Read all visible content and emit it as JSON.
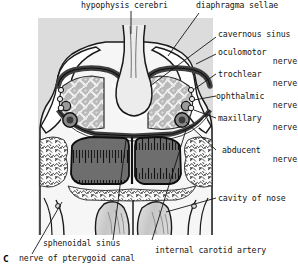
{
  "figure": {
    "panel_key": "C",
    "caption_label": "nerve of pterygoid canal",
    "background": "#ffffff",
    "panel_background": "#dcdcdc",
    "ink": "#141414",
    "colors": {
      "panel_bg": "#dcdcdc",
      "bone_light": "#f2f2f2",
      "dura_dark": "#4a4a4a",
      "cavernous_sinus_fill": "#b8b8b8",
      "sphenoid_sinus_fill": "#6e6e6e",
      "concha_fill": "#cfcfcf",
      "pituitary_fill": "#e8e8e8",
      "leader_line": "#1a1a1a"
    },
    "labels": [
      {
        "id": "hypophysis-cerebri",
        "text": "hypophysis cerebri",
        "line1": "hypophysis cerebri",
        "line2": ""
      },
      {
        "id": "diaphragma-sellae",
        "text": "diaphragma sellae",
        "line1": "diaphragma sellae",
        "line2": ""
      },
      {
        "id": "cavernous-sinus",
        "text": "cavernous sinus",
        "line1": "cavernous sinus",
        "line2": ""
      },
      {
        "id": "oculomotor-nerve",
        "text": "oculomotor nerve",
        "line1": "oculomotor",
        "line2": "nerve"
      },
      {
        "id": "trochlear-nerve",
        "text": "trochlear nerve",
        "line1": "trochlear",
        "line2": "nerve"
      },
      {
        "id": "ophthalmic-nerve",
        "text": "ophthalmic nerve",
        "line1": "ophthalmic",
        "line2": "nerve"
      },
      {
        "id": "maxillary-nerve",
        "text": "maxillary nerve",
        "line1": "maxillary",
        "line2": "nerve"
      },
      {
        "id": "abducent-nerve",
        "text": "abducent nerve",
        "line1": "abducent",
        "line2": "nerve"
      },
      {
        "id": "cavity-of-nose",
        "text": "cavity of nose",
        "line1": "cavity of nose",
        "line2": ""
      },
      {
        "id": "sphenoidal-sinus",
        "text": "sphenoidal sinus",
        "line1": "sphenoidal sinus",
        "line2": ""
      },
      {
        "id": "internal-carotid-artery",
        "text": "internal carotid artery",
        "line1": "internal carotid artery",
        "line2": ""
      },
      {
        "id": "nerve-of-pterygoid-canal",
        "text": "nerve of pterygoid canal",
        "line1": "nerve of pterygoid canal",
        "line2": ""
      }
    ]
  }
}
